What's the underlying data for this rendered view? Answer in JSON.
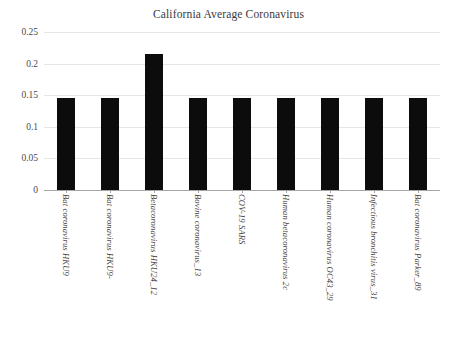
{
  "chart_data": {
    "type": "bar",
    "title": "California Average Coronavirus",
    "xlabel": "",
    "ylabel": "",
    "ylim": [
      0,
      0.25
    ],
    "yticks": [
      "0",
      "0.05",
      "0.1",
      "0.15",
      "0.2",
      "0.25"
    ],
    "ytick_values": [
      0,
      0.05,
      0.1,
      0.15,
      0.2,
      0.25
    ],
    "grid": true,
    "legend": "none",
    "bar_color": "#0c0c0c",
    "gridline_color": "#e6e6e6",
    "axis_color": "#a6a6a6",
    "categories": [
      "Bat coronavirus HKU9",
      "Bat coronavirus HKU9-",
      "Betacoronavirus HKU24_12",
      "Bovine coronavirus_13",
      "COV-19 SARS",
      "Human betacoronavirus 2c",
      "Human coronavirus OC43_29",
      "Infectious bronchitis virus_31",
      "Bat coronavirus Parker_89"
    ],
    "values": [
      0.145,
      0.145,
      0.216,
      0.145,
      0.145,
      0.145,
      0.145,
      0.145,
      0.145
    ]
  }
}
